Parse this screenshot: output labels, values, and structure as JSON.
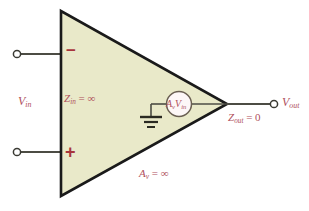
{
  "figure": {
    "colors": {
      "triangle_fill": "#e9e9c9",
      "triangle_stroke": "#1a1a1a",
      "wire": "#4c4c44",
      "label_red": "#b0505c",
      "sign_red": "#a8353c",
      "source_fill": "#fdf7f7",
      "background": "#ffffff"
    },
    "amplifier": {
      "shape": "triangle",
      "inverting_sign": "−",
      "noninverting_sign": "+"
    },
    "labels": {
      "v_in": {
        "base": "V",
        "sub": "in"
      },
      "z_in": {
        "base": "Z",
        "sub": "in",
        "rel": " = ∞"
      },
      "a_v": {
        "base": "A",
        "sub": "v",
        "rel": " = ∞"
      },
      "z_out": {
        "base": "Z",
        "sub": "out",
        "rel": " = 0"
      },
      "v_out": {
        "base": "V",
        "sub": "out"
      },
      "dependent_source": {
        "gain_base": "A",
        "gain_sub": "v",
        "volt_base": "V",
        "volt_sub": "in"
      }
    },
    "nodes": {
      "inverting_terminal": "open-circle-terminal",
      "noninverting_terminal": "open-circle-terminal",
      "output_terminal": "open-circle-terminal",
      "ground": "ground-symbol"
    }
  }
}
